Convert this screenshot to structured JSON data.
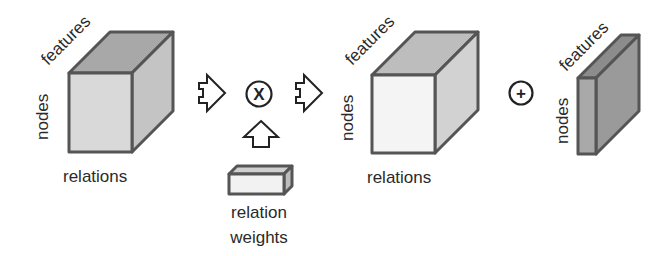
{
  "diagram": {
    "type": "tensor-operation-flow",
    "cube_input": {
      "labels": {
        "top": "features",
        "left": "nodes",
        "bottom": "relations"
      },
      "colors": {
        "front": "#d9d9d9",
        "top": "#a8a8a8",
        "side": "#c4c4c4"
      }
    },
    "operator_multiply": {
      "symbol": "X",
      "name": "multiply"
    },
    "relation_weights": {
      "label_line1": "relation",
      "label_line2": "weights",
      "colors": {
        "front": "#f2f2f2",
        "top": "#cfcfcf",
        "side": "#bdbdbd"
      }
    },
    "cube_output": {
      "labels": {
        "top": "features",
        "left": "nodes",
        "bottom": "relations"
      },
      "colors": {
        "front": "#f4f4f4",
        "top": "#bdbdbd",
        "side": "#d2d2d2"
      }
    },
    "operator_add": {
      "symbol": "+",
      "name": "add"
    },
    "slab_result": {
      "labels": {
        "top": "features",
        "left": "nodes"
      },
      "colors": {
        "front": "#a9a9a9",
        "top": "#8c8c8c",
        "side": "#9a9a9a"
      }
    }
  }
}
